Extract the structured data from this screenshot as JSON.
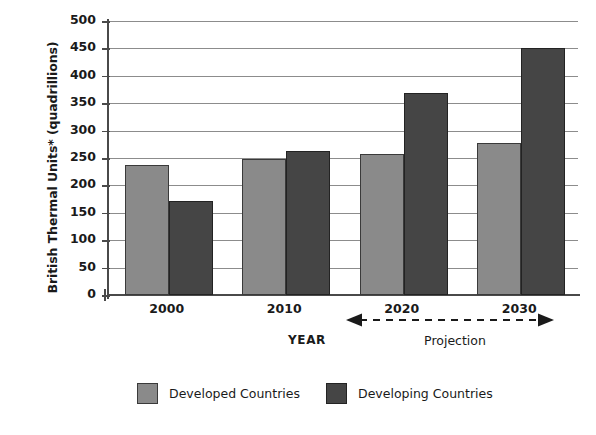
{
  "chart_data": {
    "type": "bar",
    "title": "",
    "subtitle": "",
    "xlabel": "YEAR",
    "ylabel": "British Thermal Units* (quadrillions)",
    "categories": [
      "2000",
      "2010",
      "2020",
      "2030"
    ],
    "series": [
      {
        "name": "Developed Countries",
        "color": "#8a8a8a",
        "values": [
          237,
          248,
          258,
          278
        ]
      },
      {
        "name": "Developing Countries",
        "color": "#454545",
        "values": [
          172,
          262,
          368,
          450
        ]
      }
    ],
    "ylim": [
      0,
      500
    ],
    "yticks": [
      0,
      50,
      100,
      150,
      200,
      250,
      300,
      350,
      400,
      450,
      500
    ],
    "ytick_labels": [
      "0",
      "50",
      "100",
      "150",
      "200",
      "250",
      "300",
      "350",
      "400",
      "450",
      "500"
    ],
    "grid": "horizontal",
    "legend_position": "bottom-center",
    "annotations": [
      {
        "name": "projection-range",
        "text": "Projection",
        "covers": [
          "2020",
          "2030"
        ],
        "style": "dashed-double-arrow"
      }
    ]
  },
  "axes": {
    "y_title": "British Thermal Units* (quadrillions)",
    "x_title": "YEAR"
  },
  "annotation": {
    "projection_label": "Projection"
  },
  "legend": {
    "items": [
      {
        "label": "Developed Countries",
        "color": "#8a8a8a"
      },
      {
        "label": "Developing Countries",
        "color": "#454545"
      }
    ]
  }
}
